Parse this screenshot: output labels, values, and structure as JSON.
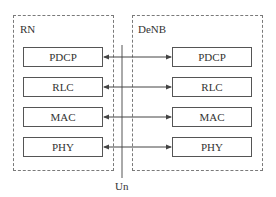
{
  "diagram": {
    "left_node": {
      "label": "RN"
    },
    "right_node": {
      "label": "DeNB"
    },
    "interface": {
      "label": "Un"
    },
    "layers": [
      {
        "left": "PDCP",
        "right": "PDCP"
      },
      {
        "left": "RLC",
        "right": "RLC"
      },
      {
        "left": "MAC",
        "right": "MAC"
      },
      {
        "left": "PHY",
        "right": "PHY"
      }
    ],
    "colors": {
      "line": "#555555",
      "dashed_border": "#7a7a7a",
      "text": "#333333"
    }
  }
}
